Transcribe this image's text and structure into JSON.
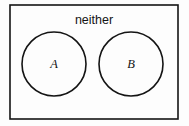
{
  "figure": {
    "type": "venn-diagram-disjoint",
    "background_color": "#fdfdfd",
    "stroke_color": "#141414",
    "text_color": "#141414"
  },
  "universe": {
    "name": "universal-set-rectangle",
    "label": "neither",
    "label_x": 94,
    "label_y": 24,
    "x": 10,
    "y": 5,
    "width": 168,
    "height": 114,
    "stroke_width": 1.6,
    "fill": "#fdfdfd"
  },
  "sets": [
    {
      "name": "set-a",
      "label": "A",
      "cx": 54,
      "cy": 64,
      "r": 32,
      "label_x": 54,
      "label_y": 68,
      "stroke_width": 1.6,
      "fill": "none"
    },
    {
      "name": "set-b",
      "label": "B",
      "cx": 131,
      "cy": 64,
      "r": 32,
      "label_x": 131,
      "label_y": 68,
      "stroke_width": 1.6,
      "fill": "none"
    }
  ]
}
